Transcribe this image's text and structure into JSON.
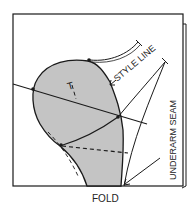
{
  "diagram": {
    "type": "sewing-pattern",
    "labels": {
      "style_line": "STYLE LINE",
      "underarm_seam": "UNDERARM SEAM",
      "fold": "FOLD",
      "grain_mark": "T"
    },
    "colors": {
      "stroke": "#1a1a1a",
      "shaded_fill": "#c4c4c4",
      "background": "#ffffff"
    }
  }
}
